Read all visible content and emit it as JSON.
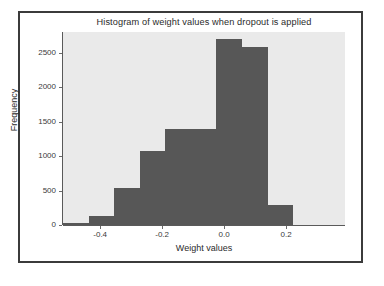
{
  "figure": {
    "title": "Histogram of weight values when dropout is applied",
    "background_color": "#ffffff",
    "frame_color": "#3b3b3b"
  },
  "chart_data": {
    "type": "bar",
    "title": "Histogram of weight values when dropout is applied",
    "xlabel": "Weight values",
    "ylabel": "Frequency",
    "xlim": [
      -0.52,
      0.39
    ],
    "ylim": [
      0,
      2800
    ],
    "grid": false,
    "legend": null,
    "bar_color": "#575757",
    "plot_background": "#eaeaea",
    "xticks": [
      -0.4,
      -0.2,
      0.0,
      0.2
    ],
    "xtick_labels": [
      "-0.4",
      "-0.2",
      "0.0",
      "0.2"
    ],
    "yticks": [
      0,
      500,
      1000,
      1500,
      2000,
      2500
    ],
    "ytick_labels": [
      "0",
      "500",
      "1000",
      "1500",
      "2000",
      "2500"
    ],
    "bin_edges": [
      -0.52,
      -0.4375,
      -0.355,
      -0.2725,
      -0.19,
      -0.1075,
      -0.025,
      0.0575,
      0.14,
      0.2225,
      0.305
    ],
    "values": [
      35,
      130,
      540,
      1080,
      1390,
      1390,
      2700,
      2580,
      290,
      0
    ],
    "bins": [
      {
        "left": -0.52,
        "right": -0.4375,
        "count": 35
      },
      {
        "left": -0.4375,
        "right": -0.355,
        "count": 130
      },
      {
        "left": -0.355,
        "right": -0.2725,
        "count": 540
      },
      {
        "left": -0.2725,
        "right": -0.19,
        "count": 1080
      },
      {
        "left": -0.19,
        "right": -0.1075,
        "count": 1390
      },
      {
        "left": -0.1075,
        "right": -0.025,
        "count": 1390
      },
      {
        "left": -0.025,
        "right": 0.0575,
        "count": 2700
      },
      {
        "left": 0.0575,
        "right": 0.14,
        "count": 2580
      },
      {
        "left": 0.14,
        "right": 0.2225,
        "count": 290
      },
      {
        "left": 0.2225,
        "right": 0.305,
        "count": 0
      }
    ]
  }
}
